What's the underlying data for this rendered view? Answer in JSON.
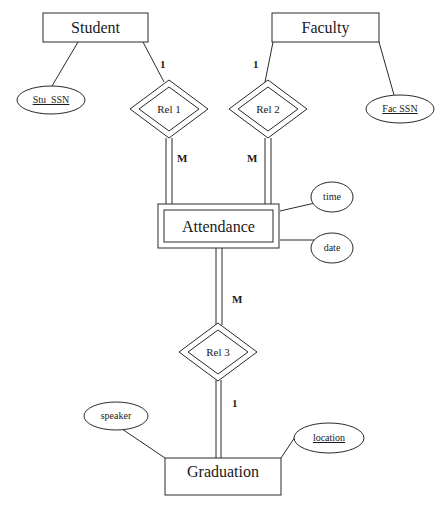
{
  "diagram": {
    "type": "er-diagram",
    "entities": [
      {
        "id": "student",
        "label": "Student",
        "weak": false
      },
      {
        "id": "faculty",
        "label": "Faculty",
        "weak": false
      },
      {
        "id": "attendance",
        "label": "Attendance",
        "weak": true
      },
      {
        "id": "graduation",
        "label": "Graduation",
        "weak": false
      }
    ],
    "relationships": [
      {
        "id": "rel1",
        "label": "Rel 1",
        "identifying": true
      },
      {
        "id": "rel2",
        "label": "Rel 2",
        "identifying": true
      },
      {
        "id": "rel3",
        "label": "Rel 3",
        "identifying": true
      }
    ],
    "attributes": [
      {
        "id": "stu_ssn",
        "label": "Stu_SSN",
        "key": true,
        "owner": "student"
      },
      {
        "id": "fac_ssn",
        "label": "Fac SSN",
        "key": true,
        "owner": "faculty"
      },
      {
        "id": "time",
        "label": "time",
        "key": false,
        "owner": "attendance"
      },
      {
        "id": "date",
        "label": "date",
        "key": false,
        "owner": "attendance"
      },
      {
        "id": "speaker",
        "label": "speaker",
        "key": false,
        "owner": "graduation"
      },
      {
        "id": "location",
        "label": "location",
        "key": true,
        "owner": "graduation"
      }
    ],
    "cardinalities": {
      "student_rel1": "1",
      "rel1_attendance": "M",
      "faculty_rel2": "1",
      "rel2_attendance": "M",
      "attendance_rel3": "M",
      "rel3_graduation": "1"
    },
    "colors": {
      "stroke": "#2a2a2a",
      "background": "#ffffff",
      "text": "#1a1a1a"
    }
  }
}
